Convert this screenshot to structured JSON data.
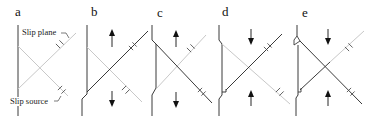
{
  "figure": {
    "panels": [
      {
        "id": "a",
        "label": "a",
        "annotations": {
          "slip_plane": "Slip plane",
          "slip_source": "Slip source"
        }
      },
      {
        "id": "b",
        "label": "b",
        "top_arrow": "up",
        "bottom_arrow": "down"
      },
      {
        "id": "c",
        "label": "c",
        "top_arrow": "up",
        "bottom_arrow": "down"
      },
      {
        "id": "d",
        "label": "d",
        "top_arrow": "down",
        "bottom_arrow": "up"
      },
      {
        "id": "e",
        "label": "e",
        "top_arrow": "down",
        "bottom_arrow": "up"
      }
    ],
    "colors": {
      "dark_line": "#3a3a3a",
      "light_line": "#c8c8c8",
      "arrow": "#111111"
    },
    "icons": {
      "arrow_up": "arrow-up-icon",
      "arrow_down": "arrow-down-icon",
      "dislocation_marker": "dislocation-tick-icon"
    }
  }
}
